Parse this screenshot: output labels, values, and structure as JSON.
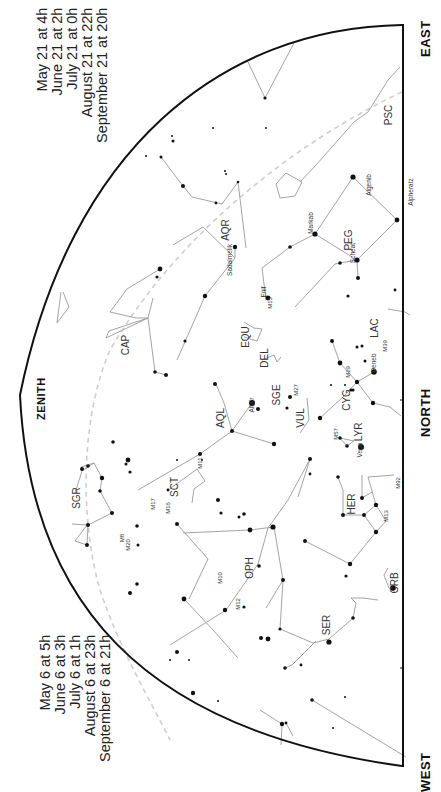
{
  "map": {
    "directions": {
      "east": "EAST",
      "north": "NORTH",
      "west": "WEST",
      "zenith": "ZENITH"
    },
    "times_east": [
      "May 21 at   4h",
      "June 21 at   2h",
      "July 21 at   0h",
      "August 21 at  22h",
      "September 21 at  20h"
    ],
    "times_west": [
      "May 6 at   5h",
      "June 6 at   3h",
      "July 6 at   1h",
      "August 6 at  23h",
      "September 6 at  21h"
    ],
    "constellations": [
      {
        "abbr": "PSC",
        "x": 392,
        "y": 115
      },
      {
        "abbr": "PEG",
        "x": 352,
        "y": 240
      },
      {
        "abbr": "AQR",
        "x": 229,
        "y": 230
      },
      {
        "abbr": "CAP",
        "x": 129,
        "y": 345
      },
      {
        "abbr": "EQU",
        "x": 249,
        "y": 337
      },
      {
        "abbr": "DEL",
        "x": 268,
        "y": 358
      },
      {
        "abbr": "LAC",
        "x": 378,
        "y": 328
      },
      {
        "abbr": "SGE",
        "x": 280,
        "y": 395
      },
      {
        "abbr": "VUL",
        "x": 304,
        "y": 418
      },
      {
        "abbr": "CYG",
        "x": 350,
        "y": 400
      },
      {
        "abbr": "LYR",
        "x": 362,
        "y": 432
      },
      {
        "abbr": "AQL",
        "x": 224,
        "y": 418
      },
      {
        "abbr": "SCT",
        "x": 178,
        "y": 487
      },
      {
        "abbr": "SGR",
        "x": 80,
        "y": 498
      },
      {
        "abbr": "HER",
        "x": 355,
        "y": 504
      },
      {
        "abbr": "OPH",
        "x": 253,
        "y": 568
      },
      {
        "abbr": "CRB",
        "x": 398,
        "y": 583
      },
      {
        "abbr": "SER",
        "x": 330,
        "y": 625
      }
    ],
    "star_names": [
      {
        "name": "Algenib",
        "x": 371,
        "y": 185
      },
      {
        "name": "Alpheratz",
        "x": 413,
        "y": 192
      },
      {
        "name": "Markab",
        "x": 313,
        "y": 223
      },
      {
        "name": "Scheat",
        "x": 355,
        "y": 253
      },
      {
        "name": "Sadalmelik",
        "x": 232,
        "y": 260
      },
      {
        "name": "Enif",
        "x": 266,
        "y": 292
      },
      {
        "name": "Deneb",
        "x": 376,
        "y": 363
      },
      {
        "name": "Altair",
        "x": 254,
        "y": 405
      },
      {
        "name": "Vega",
        "x": 362,
        "y": 450
      }
    ],
    "deep_sky": [
      {
        "name": "M15",
        "x": 272,
        "y": 303
      },
      {
        "name": "M39",
        "x": 387,
        "y": 346
      },
      {
        "name": "M27",
        "x": 298,
        "y": 390
      },
      {
        "name": "M29",
        "x": 350,
        "y": 372
      },
      {
        "name": "M57",
        "x": 338,
        "y": 434
      },
      {
        "name": "M92",
        "x": 400,
        "y": 483
      },
      {
        "name": "M13",
        "x": 388,
        "y": 516
      },
      {
        "name": "M11",
        "x": 202,
        "y": 463
      },
      {
        "name": "M16",
        "x": 170,
        "y": 508
      },
      {
        "name": "M17",
        "x": 155,
        "y": 504
      },
      {
        "name": "M8",
        "x": 124,
        "y": 538
      },
      {
        "name": "M20",
        "x": 130,
        "y": 545
      },
      {
        "name": "M10",
        "x": 222,
        "y": 578
      },
      {
        "name": "M12",
        "x": 240,
        "y": 604
      }
    ],
    "colors": {
      "frame": "#111111",
      "line": "#9a9a9a",
      "star": "#111111",
      "ecliptic": "#c8c8c8"
    }
  }
}
